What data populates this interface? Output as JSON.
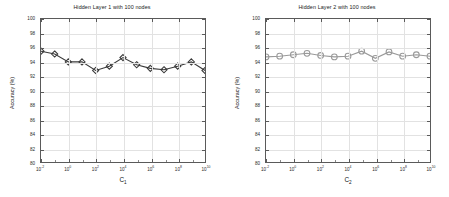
{
  "figure": {
    "width": 449,
    "height": 197,
    "background": "#ffffff"
  },
  "chart_data": [
    {
      "type": "line",
      "panel": "left",
      "title": "Hidden Layer 1 with 100 nodes",
      "xlabel": "C_1",
      "xlabel_base": "C",
      "xlabel_sub": "1",
      "ylabel": "Accuracy (%)",
      "xscale": "log",
      "xlim": [
        0.01,
        10000000000
      ],
      "ylim": [
        80,
        100
      ],
      "yticks": [
        80,
        82,
        84,
        86,
        88,
        90,
        92,
        94,
        96,
        98,
        100
      ],
      "ytick_labels": [
        "80",
        "82",
        "84",
        "86",
        "88",
        "90",
        "92",
        "94",
        "96",
        "98",
        "100"
      ],
      "xticks": [
        0.01,
        1,
        100,
        10000,
        1000000,
        100000000,
        10000000000
      ],
      "xtick_labels": [
        "10^-2",
        "10^0",
        "10^2",
        "10^4",
        "10^6",
        "10^8",
        "10^10"
      ],
      "xtick_exponents": [
        -2,
        0,
        2,
        4,
        6,
        8,
        10
      ],
      "grid": true,
      "marker": "diamond",
      "marker_color": "#3a3a3a",
      "line_color": "#3a3a3a",
      "x": [
        0.01,
        0.1,
        1,
        10,
        100,
        1000,
        10000,
        100000,
        1000000,
        10000000,
        100000000,
        1000000000,
        10000000000
      ],
      "values": [
        95.5,
        95.1,
        94.0,
        94.0,
        92.8,
        93.4,
        94.6,
        93.6,
        93.1,
        92.9,
        93.4,
        94.0,
        92.8
      ],
      "legend": null
    },
    {
      "type": "line",
      "panel": "right",
      "title": "Hidden Layer 2 with 100 nodes",
      "xlabel": "C_2",
      "xlabel_base": "C",
      "xlabel_sub": "2",
      "ylabel": "Accuracy (%)",
      "xscale": "log",
      "xlim": [
        0.01,
        10000000000
      ],
      "ylim": [
        80,
        100
      ],
      "yticks": [
        80,
        82,
        84,
        86,
        88,
        90,
        92,
        94,
        96,
        98,
        100
      ],
      "ytick_labels": [
        "80",
        "82",
        "84",
        "86",
        "88",
        "90",
        "92",
        "94",
        "96",
        "98",
        "100"
      ],
      "xticks": [
        0.01,
        1,
        100,
        10000,
        1000000,
        100000000,
        10000000000
      ],
      "xtick_labels": [
        "10^-2",
        "10^0",
        "10^2",
        "10^4",
        "10^6",
        "10^8",
        "10^10"
      ],
      "xtick_exponents": [
        -2,
        0,
        2,
        4,
        6,
        8,
        10
      ],
      "grid": true,
      "marker": "circle",
      "marker_color": "#9a9a9a",
      "line_color": "#9a9a9a",
      "x": [
        0.01,
        0.1,
        1,
        10,
        100,
        1000,
        10000,
        100000,
        1000000,
        10000000,
        100000000,
        1000000000,
        10000000000
      ],
      "values": [
        94.7,
        94.8,
        95.0,
        95.2,
        94.9,
        94.7,
        94.8,
        95.5,
        94.5,
        95.4,
        94.8,
        95.0,
        94.8
      ],
      "legend": null
    }
  ]
}
